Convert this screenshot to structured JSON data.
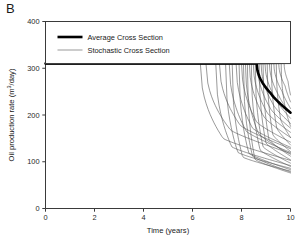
{
  "panel": {
    "label": "B"
  },
  "chart_data": {
    "type": "line",
    "title": "",
    "xlabel": "Time (years)",
    "ylabel": "Oil production rate (m3/day)",
    "ylabel_parts": {
      "text": "Oil production rate (m",
      "sup": "3",
      "tail": "/day)"
    },
    "xlim": [
      0,
      10
    ],
    "ylim": [
      0,
      400
    ],
    "xticks": [
      0,
      2,
      4,
      6,
      8,
      10
    ],
    "yticks": [
      0,
      100,
      200,
      300,
      400
    ],
    "grid": false,
    "legend_position": "top-inside",
    "plateau_rate": 310,
    "legend": [
      {
        "name": "Average Cross Section",
        "style": "thick-black",
        "color": "#000000",
        "width": 2.6
      },
      {
        "name": "Stochastic Cross Section",
        "style": "thin-gray",
        "color": "#555555",
        "width": 0.6
      }
    ],
    "series": [
      {
        "name": "Average Cross Section",
        "kind": "average",
        "breakthrough": 8.6,
        "end_value": 205,
        "color": "#000000"
      },
      {
        "name": "Stochastic Cross Section",
        "kind": "stochastic",
        "count": 30,
        "breakthrough_range": [
          6.3,
          9.6
        ],
        "end_value_range": [
          75,
          245
        ],
        "color": "#555555"
      }
    ],
    "stochastic_curves": [
      {
        "t0": 6.32,
        "t_knee": 7.25,
        "y_knee": 150,
        "t_end": 10.0,
        "y_end": 103,
        "steep": 0.88
      },
      {
        "t0": 6.55,
        "t_knee": 7.55,
        "y_knee": 168,
        "t_end": 10.0,
        "y_end": 118,
        "steep": 0.82
      },
      {
        "t0": 6.95,
        "t_knee": 7.6,
        "y_knee": 132,
        "t_end": 10.0,
        "y_end": 92,
        "steep": 0.95
      },
      {
        "t0": 7.1,
        "t_knee": 7.95,
        "y_knee": 178,
        "t_end": 10.0,
        "y_end": 128,
        "steep": 0.8
      },
      {
        "t0": 7.35,
        "t_knee": 7.85,
        "y_knee": 120,
        "t_end": 10.0,
        "y_end": 86,
        "steep": 1.0
      },
      {
        "t0": 7.5,
        "t_knee": 8.2,
        "y_knee": 165,
        "t_end": 10.0,
        "y_end": 120,
        "steep": 0.86
      },
      {
        "t0": 7.62,
        "t_knee": 8.05,
        "y_knee": 110,
        "t_end": 10.0,
        "y_end": 80,
        "steep": 1.05
      },
      {
        "t0": 7.78,
        "t_knee": 8.45,
        "y_knee": 172,
        "t_end": 10.0,
        "y_end": 131,
        "steep": 0.84
      },
      {
        "t0": 7.9,
        "t_knee": 8.3,
        "y_knee": 118,
        "t_end": 10.0,
        "y_end": 83,
        "steep": 1.02
      },
      {
        "t0": 8.0,
        "t_knee": 8.62,
        "y_knee": 185,
        "t_end": 10.0,
        "y_end": 142,
        "steep": 0.8
      },
      {
        "t0": 8.08,
        "t_knee": 8.45,
        "y_knee": 112,
        "t_end": 10.0,
        "y_end": 78,
        "steep": 1.08
      },
      {
        "t0": 8.16,
        "t_knee": 8.7,
        "y_knee": 160,
        "t_end": 10.0,
        "y_end": 116,
        "steep": 0.88
      },
      {
        "t0": 8.24,
        "t_knee": 8.55,
        "y_knee": 105,
        "t_end": 10.0,
        "y_end": 76,
        "steep": 1.12
      },
      {
        "t0": 8.32,
        "t_knee": 8.92,
        "y_knee": 196,
        "t_end": 10.0,
        "y_end": 152,
        "steep": 0.78
      },
      {
        "t0": 8.4,
        "t_knee": 8.76,
        "y_knee": 125,
        "t_end": 10.0,
        "y_end": 90,
        "steep": 0.98
      },
      {
        "t0": 8.48,
        "t_knee": 9.05,
        "y_knee": 205,
        "t_end": 10.0,
        "y_end": 163,
        "steep": 0.76
      },
      {
        "t0": 8.56,
        "t_knee": 8.88,
        "y_knee": 132,
        "t_end": 10.0,
        "y_end": 97,
        "steep": 0.96
      },
      {
        "t0": 8.64,
        "t_knee": 9.18,
        "y_knee": 214,
        "t_end": 10.0,
        "y_end": 172,
        "steep": 0.74
      },
      {
        "t0": 8.72,
        "t_knee": 9.0,
        "y_knee": 140,
        "t_end": 10.0,
        "y_end": 104,
        "steep": 0.94
      },
      {
        "t0": 8.8,
        "t_knee": 9.3,
        "y_knee": 222,
        "t_end": 10.0,
        "y_end": 182,
        "steep": 0.72
      },
      {
        "t0": 8.88,
        "t_knee": 9.12,
        "y_knee": 148,
        "t_end": 10.0,
        "y_end": 112,
        "steep": 0.92
      },
      {
        "t0": 8.96,
        "t_knee": 9.42,
        "y_knee": 232,
        "t_end": 10.0,
        "y_end": 193,
        "steep": 0.7
      },
      {
        "t0": 9.05,
        "t_knee": 9.28,
        "y_knee": 158,
        "t_end": 10.0,
        "y_end": 122,
        "steep": 0.9
      },
      {
        "t0": 9.14,
        "t_knee": 9.54,
        "y_knee": 240,
        "t_end": 10.0,
        "y_end": 203,
        "steep": 0.68
      },
      {
        "t0": 9.22,
        "t_knee": 9.44,
        "y_knee": 172,
        "t_end": 10.0,
        "y_end": 136,
        "steep": 0.88
      },
      {
        "t0": 9.32,
        "t_knee": 9.66,
        "y_knee": 250,
        "t_end": 10.0,
        "y_end": 214,
        "steep": 0.66
      },
      {
        "t0": 9.42,
        "t_knee": 9.6,
        "y_knee": 190,
        "t_end": 10.0,
        "y_end": 152,
        "steep": 0.86
      },
      {
        "t0": 9.52,
        "t_knee": 9.78,
        "y_knee": 262,
        "t_end": 10.0,
        "y_end": 228,
        "steep": 0.64
      },
      {
        "t0": 9.62,
        "t_knee": 9.8,
        "y_knee": 212,
        "t_end": 10.0,
        "y_end": 176,
        "steep": 0.84
      },
      {
        "t0": 9.74,
        "t_knee": 9.9,
        "y_knee": 272,
        "t_end": 10.0,
        "y_end": 243,
        "steep": 0.62
      }
    ],
    "average_curve": {
      "t0": 8.62,
      "t_knee": 9.2,
      "y_knee": 246,
      "t_end": 10.0,
      "y_end": 205,
      "steep": 0.74
    }
  }
}
